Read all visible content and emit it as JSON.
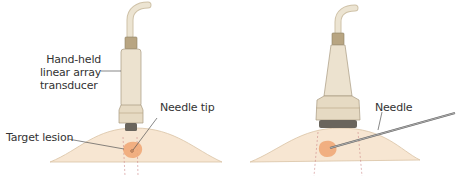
{
  "panels": [
    {
      "id": "left",
      "labels": {
        "transducer_line1": "Hand-held",
        "transducer_line2": "linear array",
        "transducer_line3": "transducer",
        "needle_tip": "Needle tip",
        "target_lesion": "Target lesion"
      }
    },
    {
      "id": "right",
      "labels": {
        "needle": "Needle"
      }
    }
  ],
  "colors": {
    "skin": "#f7e6d2",
    "skin_edge": "#d9c3a5",
    "lesion": "#f0a878",
    "probe_body": "#ece2cf",
    "probe_band": "#b8a582",
    "probe_tip": "#6a655d",
    "cable": "#e4dac6",
    "needle": "#555555"
  }
}
